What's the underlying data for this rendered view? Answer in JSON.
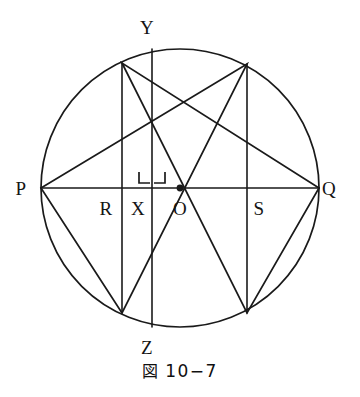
{
  "figure": {
    "caption_symbol": "図",
    "caption_number": "10−7",
    "caption_full": "図 10−7",
    "stroke_color": "#1a1a1a",
    "background_color": "#ffffff",
    "stroke_width": 1.6
  },
  "labels": {
    "p": "P",
    "q": "Q",
    "y": "Y",
    "z": "Z",
    "r": "R",
    "x": "X",
    "o": "O",
    "s": "S"
  },
  "chart_data": {
    "type": "diagram",
    "circle": {
      "cx": 180,
      "cy": 188,
      "r": 139
    },
    "points": [
      {
        "name": "P",
        "x": 41,
        "y": 188,
        "on": "circle",
        "label_dx": -20,
        "label_dy": 0
      },
      {
        "name": "Q",
        "x": 319,
        "y": 188,
        "on": "circle",
        "label_dx": 10,
        "label_dy": 0
      },
      {
        "name": "Y",
        "x": 152,
        "y": 49,
        "on": "circle",
        "label_dx": -5,
        "label_dy": -22
      },
      {
        "name": "Z",
        "x": 152,
        "y": 327,
        "on": "circle",
        "label_dx": -5,
        "label_dy": 20
      },
      {
        "name": "O",
        "x": 180,
        "y": 188,
        "on": "centre",
        "label_dx": 0,
        "label_dy": 20,
        "marker": "filled-dot"
      },
      {
        "name": "R",
        "x": 122,
        "y": 188,
        "on": "diameter",
        "label_dx": -16,
        "label_dy": 20
      },
      {
        "name": "X",
        "x": 152,
        "y": 188,
        "on": "diameter",
        "label_dx": -14,
        "label_dy": 20
      },
      {
        "name": "S",
        "x": 247,
        "y": 188,
        "on": "diameter",
        "label_dx": 12,
        "label_dy": 20
      }
    ],
    "hexagon_vertices": [
      {
        "name": "upper-left",
        "x": 122,
        "y": 63
      },
      {
        "name": "upper-right",
        "x": 247,
        "y": 64
      },
      {
        "name": "lower-left",
        "x": 122,
        "y": 313
      },
      {
        "name": "lower-right",
        "x": 247,
        "y": 313
      }
    ],
    "segments": [
      {
        "name": "diameter-PQ",
        "from": [
          41,
          188
        ],
        "to": [
          319,
          188
        ]
      },
      {
        "name": "triangle-upper-P-to-upper-right",
        "from": [
          41,
          188
        ],
        "to": [
          247,
          64
        ]
      },
      {
        "name": "triangle-upper-right-to-lower-left",
        "from": [
          247,
          64
        ],
        "to": [
          122,
          313
        ]
      },
      {
        "name": "triangle-lower-left-to-P",
        "from": [
          122,
          313
        ],
        "to": [
          41,
          188
        ]
      },
      {
        "name": "triangle-lower-Q-to-upper-left",
        "from": [
          319,
          188
        ],
        "to": [
          122,
          63
        ]
      },
      {
        "name": "triangle-upper-left-to-lower-right",
        "from": [
          122,
          63
        ],
        "to": [
          247,
          313
        ]
      },
      {
        "name": "triangle-lower-right-to-Q",
        "from": [
          247,
          313
        ],
        "to": [
          319,
          188
        ]
      },
      {
        "name": "vertical-chord-through-R",
        "from": [
          122,
          63
        ],
        "to": [
          122,
          313
        ]
      },
      {
        "name": "vertical-chord-YZ-through-X",
        "from": [
          152,
          49
        ],
        "to": [
          152,
          327
        ]
      },
      {
        "name": "vertical-chord-through-S",
        "from": [
          247,
          64
        ],
        "to": [
          247,
          313
        ]
      }
    ],
    "right_angle_marks": [
      {
        "at": [
          152,
          188
        ],
        "side": "upper-left",
        "size": 11
      },
      {
        "at": [
          152,
          188
        ],
        "side": "upper-right",
        "size": 11
      }
    ]
  }
}
